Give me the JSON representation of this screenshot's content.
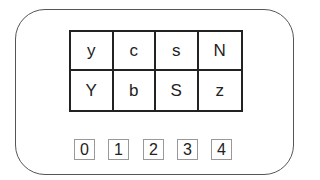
{
  "grid": {
    "rows": [
      [
        "y",
        "c",
        "s",
        "N"
      ],
      [
        "Y",
        "b",
        "S",
        "z"
      ]
    ]
  },
  "index_labels": [
    "0",
    "1",
    "2",
    "3",
    "4"
  ]
}
